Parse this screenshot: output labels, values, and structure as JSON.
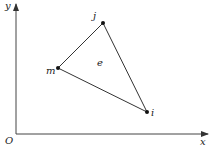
{
  "diagram": {
    "axes": {
      "x_label": "x",
      "y_label": "y",
      "origin_label": "O"
    },
    "element_label": "e",
    "nodes": [
      {
        "id": "j",
        "label": "j",
        "x": 103,
        "y": 23
      },
      {
        "id": "m",
        "label": "m",
        "x": 58,
        "y": 68
      },
      {
        "id": "i",
        "label": "i",
        "x": 147,
        "y": 112
      }
    ],
    "colors": {
      "line": "#333333",
      "node": "#111111"
    }
  }
}
